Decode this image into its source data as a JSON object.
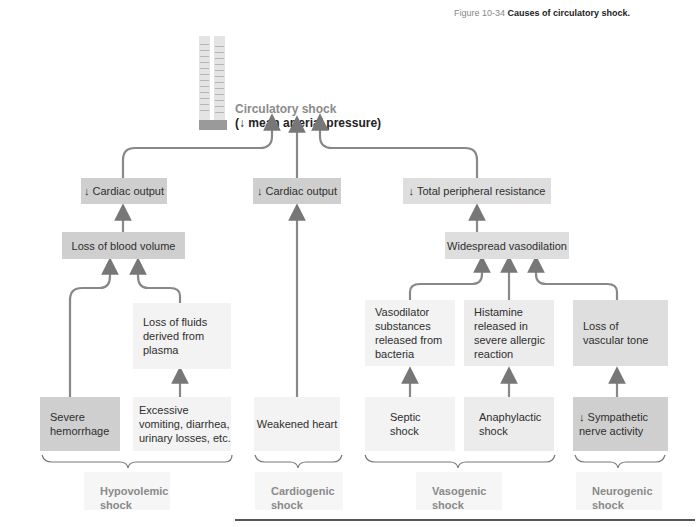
{
  "caption": {
    "figure_number": "Figure 10-34",
    "title": "Causes of circulatory shock."
  },
  "top": {
    "title_line1": "Circulatory shock",
    "title_line2": "(↓ mean arterial pressure)"
  },
  "level2": {
    "cardiac_output_left": "↓ Cardiac output",
    "cardiac_output_center": "↓ Cardiac output",
    "total_peripheral_resistance": "↓ Total peripheral resistance"
  },
  "level3": {
    "loss_blood_volume": "Loss of blood volume",
    "widespread_vasodilation": "Widespread vasodilation"
  },
  "level4": {
    "loss_fluids": "Loss of fluids derived from plasma",
    "vasodilator_substances": "Vasodilator substances released from bacteria",
    "histamine": "Histamine released in severe allergic reaction",
    "loss_vascular_tone": "Loss of vascular tone"
  },
  "level5": {
    "severe_hemorrhage": "Severe hemorrhage",
    "excessive_vomiting": "Excessive vomiting, diarrhea, urinary losses, etc.",
    "weakened_heart": "Weakened heart",
    "septic_shock": "Septic shock",
    "anaphylactic_shock": "Anaphylactic shock",
    "sympathetic": "↓ Sympathetic nerve activity"
  },
  "categories": {
    "hypovolemic": "Hypovolemic shock",
    "cardiogenic": "Cardiogenic shock",
    "vasogenic": "Vasogenic shock",
    "neurogenic": "Neurogenic shock"
  },
  "icons": {
    "gauge": "sphygmomanometer-gauge-icon"
  }
}
